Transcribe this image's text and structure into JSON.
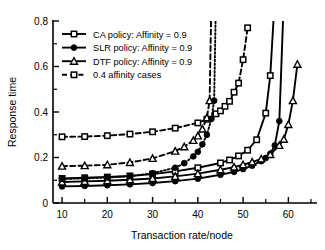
{
  "chart_data": {
    "type": "line",
    "title": "",
    "xlabel": "Transaction rate/node",
    "ylabel": "Response time",
    "xlim": [
      8,
      65
    ],
    "ylim": [
      0,
      0.8
    ],
    "xticks": [
      10,
      20,
      30,
      40,
      50,
      60
    ],
    "xtick_labels": [
      "10",
      "20",
      "30",
      "40",
      "50",
      "60"
    ],
    "xminor_ticks": [
      15,
      25,
      35,
      45,
      55,
      65
    ],
    "yticks": [
      0,
      0.2,
      0.4,
      0.6,
      0.8
    ],
    "ytick_labels": [
      "0",
      "0.2",
      "0.4",
      "0.6",
      "0.8"
    ],
    "yminor_ticks": [
      0.1,
      0.3,
      0.5,
      0.7
    ],
    "grid": false,
    "legend_position": "upper-left",
    "series": [
      {
        "name": "CA policy: Affinity = 0.9",
        "marker": "open-square",
        "line": "solid",
        "color": "#000000",
        "x": [
          10,
          15,
          20,
          25,
          30,
          35,
          40,
          45,
          47,
          49,
          51,
          53,
          55,
          56,
          57
        ],
        "y": [
          0.108,
          0.111,
          0.114,
          0.119,
          0.127,
          0.139,
          0.155,
          0.176,
          0.189,
          0.207,
          0.232,
          0.278,
          0.395,
          0.56,
          0.9
        ]
      },
      {
        "name": "SLR policy: Affinity = 0.9",
        "marker": "filled-circle",
        "line": "solid",
        "color": "#000000",
        "x": [
          10,
          15,
          20,
          25,
          30,
          35,
          40,
          45,
          48,
          50,
          52,
          54,
          55,
          56,
          57,
          58,
          59
        ],
        "y": [
          0.073,
          0.075,
          0.078,
          0.082,
          0.088,
          0.096,
          0.107,
          0.124,
          0.137,
          0.149,
          0.164,
          0.184,
          0.198,
          0.216,
          0.253,
          0.36,
          0.9
        ]
      },
      {
        "name": "DTF policy: Affinity = 0.9",
        "marker": "open-triangle",
        "line": "solid",
        "color": "#000000",
        "x": [
          10,
          15,
          20,
          25,
          30,
          35,
          40,
          45,
          48,
          50,
          52,
          54,
          56,
          58,
          59,
          60,
          61,
          62
        ],
        "y": [
          0.092,
          0.095,
          0.098,
          0.102,
          0.108,
          0.117,
          0.129,
          0.146,
          0.158,
          0.168,
          0.18,
          0.194,
          0.213,
          0.253,
          0.28,
          0.345,
          0.45,
          0.61
        ]
      },
      {
        "name": "0.4 affinity cases",
        "marker": "open-square",
        "line": "dashed",
        "color": "#000000",
        "note": "CA policy, 0.4 affinity",
        "x": [
          10,
          15,
          20,
          25,
          30,
          35,
          40,
          42,
          44,
          45,
          46,
          47,
          48,
          49,
          50,
          51
        ],
        "y": [
          0.291,
          0.292,
          0.296,
          0.303,
          0.313,
          0.329,
          0.352,
          0.368,
          0.392,
          0.405,
          0.425,
          0.447,
          0.487,
          0.527,
          0.63,
          0.77
        ]
      },
      {
        "name": "0.4 affinity cases",
        "marker": "open-triangle",
        "line": "dashed",
        "color": "#000000",
        "note": "DTF policy, 0.4 affinity",
        "x": [
          10,
          15,
          20,
          25,
          30,
          35,
          37,
          39,
          40,
          41,
          42,
          42.6,
          43
        ],
        "y": [
          0.162,
          0.164,
          0.168,
          0.178,
          0.196,
          0.228,
          0.247,
          0.275,
          0.295,
          0.325,
          0.375,
          0.45,
          0.9
        ]
      },
      {
        "name": "0.4 affinity cases",
        "marker": "filled-circle",
        "line": "dotted",
        "color": "#000000",
        "note": "SLR policy, 0.4 affinity",
        "x": [
          10,
          15,
          20,
          25,
          30,
          35,
          37,
          39,
          40,
          41,
          42,
          43,
          43.6,
          44
        ],
        "y": [
          0.106,
          0.108,
          0.112,
          0.118,
          0.131,
          0.155,
          0.175,
          0.205,
          0.225,
          0.258,
          0.3,
          0.37,
          0.45,
          0.9
        ]
      }
    ],
    "legend": [
      {
        "label": "CA policy: Affinity = 0.9",
        "marker": "open-square",
        "line": "solid"
      },
      {
        "label": "SLR policy: Affinity = 0.9",
        "marker": "filled-circle",
        "line": "solid"
      },
      {
        "label": "DTF policy: Affinity = 0.9",
        "marker": "open-triangle",
        "line": "solid"
      },
      {
        "label": "0.4 affinity cases",
        "marker": "open-square",
        "line": "dashed"
      }
    ]
  }
}
